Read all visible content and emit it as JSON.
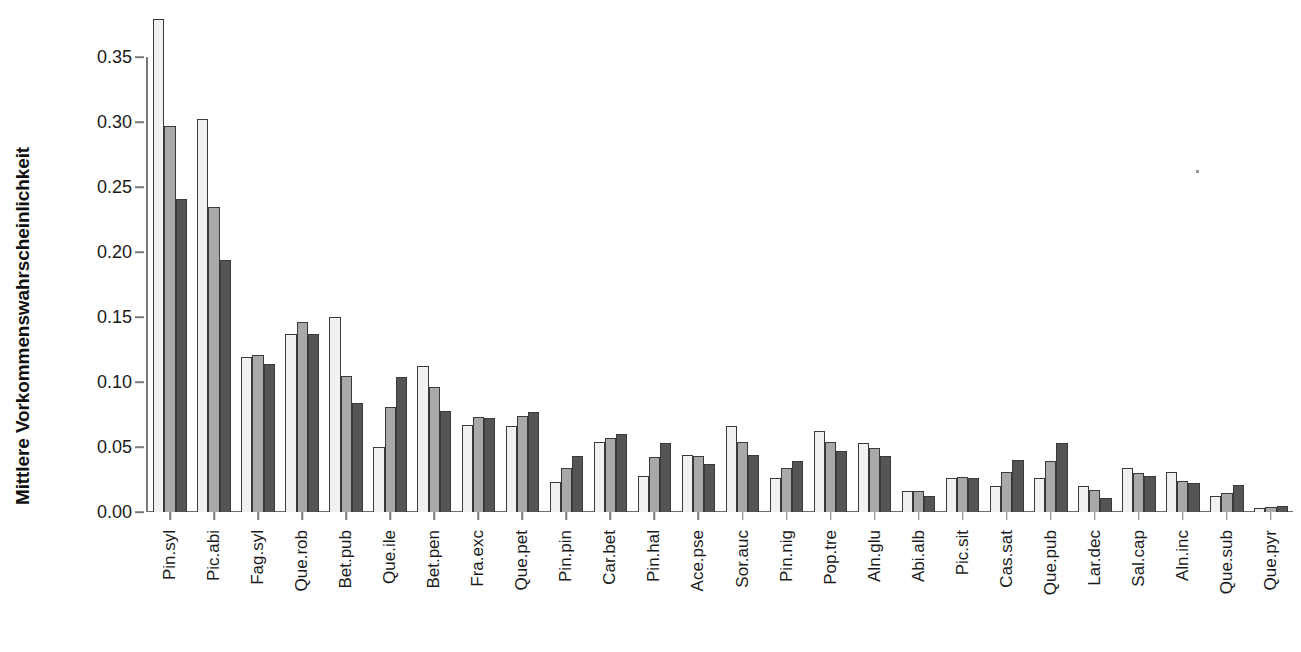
{
  "chart_data": {
    "type": "bar",
    "title": "",
    "xlabel": "",
    "ylabel": "Mittlere Vorkommenswahrscheinlichkeit",
    "ylim": [
      0.0,
      0.38
    ],
    "grid": false,
    "legend_position": "none",
    "ytick_labels": [
      "0.00",
      "0.05",
      "0.10",
      "0.15",
      "0.20",
      "0.25",
      "0.30",
      "0.35"
    ],
    "ytick_values": [
      0.0,
      0.05,
      0.1,
      0.15,
      0.2,
      0.25,
      0.3,
      0.35
    ],
    "categories": [
      "Pin.syl",
      "Pic.abi",
      "Fag.syl",
      "Que.rob",
      "Bet.pub",
      "Que.ile",
      "Bet.pen",
      "Fra.exc",
      "Que.pet",
      "Pin.pin",
      "Car.bet",
      "Pin.hal",
      "Ace.pse",
      "Sor.auc",
      "Pin.nig",
      "Pop.tre",
      "Aln.glu",
      "Abi.alb",
      "Pic.sit",
      "Cas.sat",
      "Que.pub",
      "Lar.dec",
      "Sal.cap",
      "Aln.inc",
      "Que.sub",
      "Que.pyr"
    ],
    "series": [
      {
        "name": "series-1",
        "color": "#f1f1ef",
        "values": [
          0.379,
          0.302,
          0.119,
          0.137,
          0.15,
          0.05,
          0.112,
          0.067,
          0.066,
          0.023,
          0.054,
          0.028,
          0.044,
          0.066,
          0.026,
          0.062,
          0.053,
          0.016,
          0.026,
          0.02,
          0.026,
          0.02,
          0.034,
          0.031,
          0.012,
          0.003
        ]
      },
      {
        "name": "series-2",
        "color": "#a9a9a9",
        "values": [
          0.297,
          0.235,
          0.121,
          0.146,
          0.105,
          0.081,
          0.096,
          0.073,
          0.074,
          0.034,
          0.057,
          0.042,
          0.043,
          0.054,
          0.034,
          0.054,
          0.049,
          0.016,
          0.027,
          0.031,
          0.039,
          0.017,
          0.03,
          0.024,
          0.015,
          0.004
        ]
      },
      {
        "name": "series-3",
        "color": "#555555",
        "values": [
          0.241,
          0.194,
          0.114,
          0.137,
          0.084,
          0.104,
          0.078,
          0.072,
          0.077,
          0.043,
          0.06,
          0.053,
          0.037,
          0.044,
          0.039,
          0.047,
          0.043,
          0.012,
          0.026,
          0.04,
          0.053,
          0.011,
          0.028,
          0.022,
          0.021,
          0.005
        ]
      }
    ]
  }
}
